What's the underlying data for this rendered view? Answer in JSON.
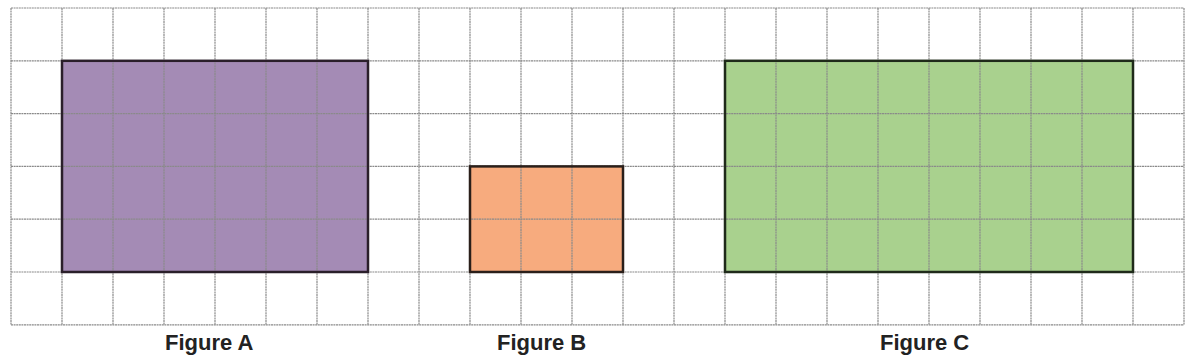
{
  "grid": {
    "origin_x": 11,
    "origin_y": 8,
    "cell_w": 51,
    "cell_h": 52.8,
    "cols": 23,
    "rows": 6,
    "line_color": "#8a8a8a"
  },
  "figures": [
    {
      "id": "A",
      "label": "Figure A",
      "col": 1,
      "row": 1,
      "width": 6,
      "height": 4,
      "fill": "#a48bb5",
      "stroke": "#2a1f2a",
      "label_x": 165
    },
    {
      "id": "B",
      "label": "Figure B",
      "col": 9,
      "row": 3,
      "width": 3,
      "height": 2,
      "fill": "#f7ab7e",
      "stroke": "#2a1f1a",
      "label_x": 497
    },
    {
      "id": "C",
      "label": "Figure C",
      "col": 14,
      "row": 1,
      "width": 8,
      "height": 4,
      "fill": "#a9d18e",
      "stroke": "#1f2a1a",
      "label_x": 880
    }
  ]
}
